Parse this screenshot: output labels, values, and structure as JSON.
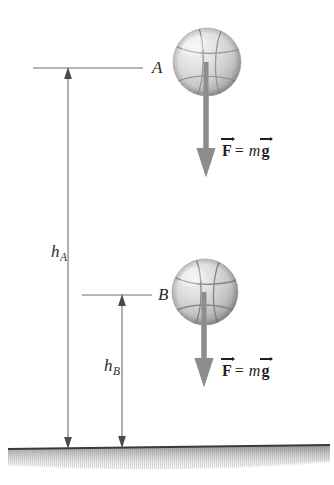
{
  "figure": {
    "type": "physics-free-body-diagram",
    "width": 334,
    "height": 485,
    "background_color": "#ffffff"
  },
  "levels": [
    {
      "id": "A",
      "label": "A",
      "line_y": 68,
      "line_x_start": 33,
      "line_x_end": 143,
      "label_x": 152,
      "label_y": 61
    },
    {
      "id": "B",
      "label": "B",
      "line_y": 295,
      "line_x_start": 82,
      "line_x_end": 152,
      "label_x": 158,
      "label_y": 288
    }
  ],
  "heights": [
    {
      "id": "hA",
      "symbol": "h",
      "subscript": "A",
      "arrow_x": 68,
      "arrow_top_y": 68,
      "arrow_bottom_y": 447,
      "label_x": 51,
      "label_y": 246
    },
    {
      "id": "hB",
      "symbol": "h",
      "subscript": "B",
      "arrow_x": 122,
      "arrow_top_y": 295,
      "arrow_bottom_y": 447,
      "label_x": 104,
      "label_y": 360
    }
  ],
  "balls": [
    {
      "id": "ball-at-A",
      "center_x": 207,
      "center_y": 62,
      "radius": 34,
      "color_light": "#efefef",
      "color_mid": "#d2d2d2",
      "color_dark": "#9a9a9a",
      "seam_color": "#8e8e8e"
    },
    {
      "id": "ball-at-B",
      "center_x": 205,
      "center_y": 292,
      "radius": 33,
      "color_light": "#efefef",
      "color_mid": "#cfcfcf",
      "color_dark": "#929292",
      "seam_color": "#7d7d7d"
    }
  ],
  "force_arrows": [
    {
      "id": "force-at-A",
      "x": 206,
      "tail_y": 60,
      "tip_y": 175,
      "shaft_width": 5,
      "head_width": 19,
      "head_height": 26,
      "color": "#8a8a8a"
    },
    {
      "id": "force-at-B",
      "x": 204,
      "tail_y": 290,
      "tip_y": 385,
      "shaft_width": 5,
      "head_width": 19,
      "head_height": 26,
      "color": "#8a8a8a"
    }
  ],
  "force_labels": [
    {
      "id": "force-label-A",
      "force_symbol": "F",
      "equals": "=",
      "mass_symbol": "m",
      "gravity_symbol": "g",
      "full_text": "F = mg",
      "x": 222,
      "y": 143
    },
    {
      "id": "force-label-B",
      "force_symbol": "F",
      "equals": "=",
      "mass_symbol": "m",
      "gravity_symbol": "g",
      "full_text": "F = mg",
      "x": 222,
      "y": 363
    }
  ],
  "ground": {
    "id": "ground-line",
    "left_x": 8,
    "left_y": 449,
    "right_x": 330,
    "right_y": 445,
    "line_color": "#3a3a3a",
    "line_width": 2,
    "shading_color": "#b5b5b5",
    "shading_depth": 22
  },
  "colors": {
    "ink": "#2b2b2b",
    "thin_line": "#6e6e6e",
    "force_gray": "#8a8a8a",
    "ground_dark": "#3a3a3a",
    "ball_highlight": "#f2f2f2"
  }
}
